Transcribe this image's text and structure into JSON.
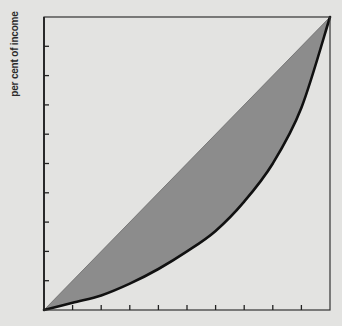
{
  "chart_data": {
    "type": "area",
    "title": "",
    "xlabel": "",
    "ylabel": "per cent of income",
    "xlim": [
      0,
      100
    ],
    "ylim": [
      0,
      100
    ],
    "x_ticks": [
      0,
      10,
      20,
      30,
      40,
      50,
      60,
      70,
      80,
      90,
      100
    ],
    "y_ticks": [
      0,
      10,
      20,
      30,
      40,
      50,
      60,
      70,
      80,
      90,
      100
    ],
    "x_tick_labels": [],
    "y_tick_labels": [],
    "grid": false,
    "legend": null,
    "series": [
      {
        "name": "line of equality",
        "style": "thin line",
        "x": [
          0,
          100
        ],
        "y": [
          0,
          100
        ]
      },
      {
        "name": "Lorenz curve",
        "style": "thick black line",
        "x": [
          0,
          10,
          20,
          30,
          40,
          50,
          60,
          70,
          80,
          90,
          100
        ],
        "y": [
          0,
          2.5,
          5,
          9,
          14,
          20,
          27,
          37,
          50,
          69,
          100
        ]
      }
    ],
    "shaded_region": {
      "between": [
        "line of equality",
        "Lorenz curve"
      ],
      "color": "#8c8c8c"
    }
  },
  "colors": {
    "background": "#e3e3e1",
    "shade": "#8c8c8c",
    "curve": "#111111",
    "axis": "#333333"
  },
  "labels": {
    "y_axis": "per cent of income"
  }
}
